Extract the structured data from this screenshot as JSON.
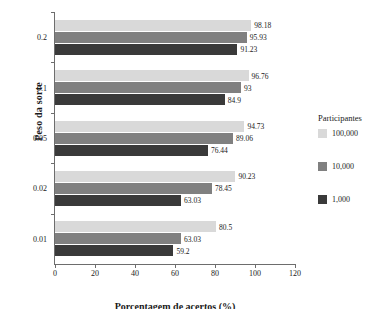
{
  "chart_data": {
    "type": "bar",
    "orientation": "horizontal",
    "title": "",
    "xlabel": "Porcentagem de acertos (%)",
    "ylabel": "Peso da sorte",
    "categories": [
      "0.2",
      "0.1",
      "0.05",
      "0.02",
      "0.01"
    ],
    "series": [
      {
        "name": "100,000",
        "color": "#d9d9d9",
        "values": [
          98.18,
          96.76,
          94.73,
          90.23,
          80.5
        ],
        "labels": [
          "98.18",
          "96.76",
          "94.73",
          "90.23",
          "80.5"
        ]
      },
      {
        "name": "10,000",
        "color": "#808080",
        "values": [
          95.93,
          93,
          89.06,
          78.45,
          63.03
        ],
        "labels": [
          "95.93",
          "93",
          "89.06",
          "78.45",
          "63.03"
        ]
      },
      {
        "name": "1,000",
        "color": "#3a3a3a",
        "values": [
          91.23,
          84.9,
          76.44,
          63.03,
          59.2
        ],
        "labels": [
          "91.23",
          "84.9",
          "76.44",
          "63.03",
          "59.2"
        ]
      }
    ],
    "xlim": [
      0,
      120
    ],
    "xticks": [
      "0",
      "20",
      "40",
      "60",
      "80",
      "100",
      "120"
    ],
    "grid": false,
    "legend": {
      "title": "Participantes",
      "position": "right",
      "entries": [
        "100,000",
        "10,000",
        "1,000"
      ]
    }
  },
  "axes": {
    "y_title": "Peso da sorte",
    "x_title": "Porcentagem de acertos (%)"
  },
  "colors": {
    "axis": "#6d6d6d",
    "text": "#1a1a1a",
    "background": "#ffffff",
    "series_light": "#d9d9d9",
    "series_mid": "#808080",
    "series_dark": "#3a3a3a"
  }
}
